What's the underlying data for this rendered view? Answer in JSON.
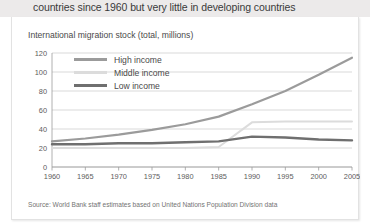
{
  "headline": {
    "text": "countries since 1960 but very little in developing countries"
  },
  "figure": {
    "subtitle": "International migration stock (total, millions)",
    "source": "Source: World Bank staff estimates based on United Nations Population Division data"
  },
  "legend": {
    "position": "inside-top-left",
    "items": [
      {
        "label": "High income",
        "color": "#9b9b9b"
      },
      {
        "label": "Middle income",
        "color": "#dcdcdc"
      },
      {
        "label": "Low income",
        "color": "#6f6f6f"
      }
    ]
  },
  "chart_data": {
    "type": "line",
    "title": "International migration stock (total, millions)",
    "xlabel": "",
    "ylabel": "",
    "grid": true,
    "xlim": [
      1960,
      2005
    ],
    "ylim": [
      0,
      120
    ],
    "yticks": [
      0,
      20,
      40,
      60,
      80,
      100,
      120
    ],
    "xticks": [
      1960,
      1965,
      1970,
      1975,
      1980,
      1985,
      1990,
      1995,
      2000,
      2005
    ],
    "x": [
      1960,
      1965,
      1970,
      1975,
      1980,
      1985,
      1990,
      1995,
      2000,
      2005
    ],
    "series": [
      {
        "name": "High income",
        "color": "#9b9b9b",
        "values": [
          27,
          30,
          34,
          39,
          45,
          53,
          66,
          80,
          97,
          115
        ]
      },
      {
        "name": "Middle income",
        "color": "#dcdcdc",
        "values": [
          20,
          20,
          20,
          20,
          20,
          21,
          47,
          48,
          48,
          48
        ]
      },
      {
        "name": "Low income",
        "color": "#6f6f6f",
        "values": [
          24,
          24,
          25,
          25,
          26,
          27,
          32,
          31,
          29,
          28
        ]
      }
    ]
  },
  "axis": {
    "y_tick_labels": [
      "0",
      "20",
      "40",
      "60",
      "80",
      "100",
      "120"
    ],
    "x_tick_labels": [
      "1960",
      "1965",
      "1970",
      "1975",
      "1980",
      "1985",
      "1990",
      "1995",
      "2000",
      "2005"
    ]
  }
}
